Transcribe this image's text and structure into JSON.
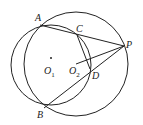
{
  "diagram": {
    "stroke_color": "#222222",
    "circles": [
      {
        "name": "circle-O1",
        "cx": 51,
        "cy": 65,
        "r": 40
      },
      {
        "name": "circle-O2",
        "cx": 76,
        "cy": 64,
        "r": 52
      }
    ],
    "segments": [
      {
        "name": "segment-AP",
        "x1": 40,
        "y1": 25,
        "x2": 124,
        "y2": 46
      },
      {
        "name": "segment-BP",
        "x1": 44,
        "y1": 108,
        "x2": 124,
        "y2": 46
      },
      {
        "name": "segment-CD",
        "x1": 77,
        "y1": 35,
        "x2": 90,
        "y2": 69
      },
      {
        "name": "segment-O2P",
        "x1": 76,
        "y1": 64,
        "x2": 124,
        "y2": 46
      }
    ],
    "points": [
      {
        "name": "point-O1",
        "cx": 51,
        "cy": 58
      }
    ],
    "labels": {
      "A": "A",
      "B": "B",
      "C": "C",
      "D": "D",
      "P": "P",
      "O1": "O",
      "O1_sub": "1",
      "O2": "O",
      "O2_sub": "2"
    }
  }
}
